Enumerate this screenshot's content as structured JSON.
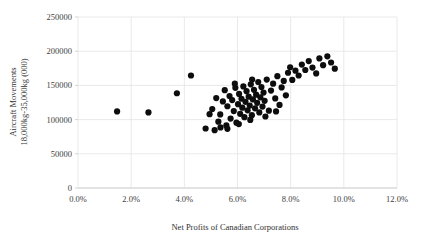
{
  "chart_data": {
    "type": "scatter",
    "title": "",
    "xlabel": "Net Profits of Canadian Corporations",
    "ylabel": "Aircraft Movements 18,000kg-35,000kg (000)",
    "ylabel_line1": "Aircraft Movements",
    "ylabel_line2": "18,000kg-35,000kg (000)",
    "xlim": [
      0,
      12
    ],
    "ylim": [
      0,
      250000
    ],
    "xticks": [
      0,
      2,
      4,
      6,
      8,
      10,
      12
    ],
    "xtick_labels": [
      "0.0%",
      "2.0%",
      "4.0%",
      "6.0%",
      "8.0%",
      "10.0%",
      "12.0%"
    ],
    "yticks": [
      0,
      50000,
      100000,
      150000,
      200000,
      250000
    ],
    "ytick_labels": [
      "0",
      "50000",
      "100000",
      "150000",
      "200000",
      "250000"
    ],
    "grid": true,
    "grid_axis": "both",
    "legend": false,
    "marker_color": "#0d0d0d",
    "marker_size": 3.1,
    "points": [
      [
        1.47,
        112000
      ],
      [
        2.65,
        110500
      ],
      [
        3.72,
        138500
      ],
      [
        4.25,
        164500
      ],
      [
        4.8,
        87000
      ],
      [
        5.05,
        115500
      ],
      [
        5.2,
        131500
      ],
      [
        5.28,
        97000
      ],
      [
        5.35,
        107500
      ],
      [
        5.45,
        126500
      ],
      [
        5.52,
        143000
      ],
      [
        5.58,
        91500
      ],
      [
        5.62,
        119500
      ],
      [
        5.7,
        134500
      ],
      [
        5.74,
        101500
      ],
      [
        5.8,
        128500
      ],
      [
        5.86,
        112500
      ],
      [
        5.92,
        146500
      ],
      [
        5.96,
        95500
      ],
      [
        6.02,
        122500
      ],
      [
        6.06,
        137500
      ],
      [
        6.1,
        108500
      ],
      [
        6.15,
        130500
      ],
      [
        6.18,
        117500
      ],
      [
        6.22,
        148500
      ],
      [
        6.26,
        103500
      ],
      [
        6.3,
        126000
      ],
      [
        6.34,
        141500
      ],
      [
        6.38,
        113500
      ],
      [
        6.42,
        133500
      ],
      [
        6.46,
        120500
      ],
      [
        6.5,
        151500
      ],
      [
        6.54,
        106500
      ],
      [
        6.58,
        129500
      ],
      [
        6.62,
        143500
      ],
      [
        6.66,
        116500
      ],
      [
        6.7,
        136500
      ],
      [
        6.74,
        124500
      ],
      [
        6.78,
        155000
      ],
      [
        6.82,
        110500
      ],
      [
        6.86,
        132500
      ],
      [
        6.9,
        147500
      ],
      [
        6.94,
        119000
      ],
      [
        6.98,
        139500
      ],
      [
        7.02,
        127500
      ],
      [
        7.1,
        158500
      ],
      [
        7.18,
        113000
      ],
      [
        7.26,
        142500
      ],
      [
        7.34,
        152500
      ],
      [
        7.42,
        131000
      ],
      [
        7.5,
        163500
      ],
      [
        7.58,
        121500
      ],
      [
        7.66,
        147000
      ],
      [
        7.74,
        156500
      ],
      [
        7.82,
        135500
      ],
      [
        7.9,
        168500
      ],
      [
        7.98,
        176500
      ],
      [
        8.06,
        158000
      ],
      [
        8.18,
        171500
      ],
      [
        8.3,
        164500
      ],
      [
        8.42,
        180500
      ],
      [
        8.55,
        172500
      ],
      [
        8.68,
        185500
      ],
      [
        8.82,
        176000
      ],
      [
        8.96,
        167500
      ],
      [
        9.08,
        189500
      ],
      [
        9.22,
        179500
      ],
      [
        9.38,
        192500
      ],
      [
        9.52,
        183500
      ],
      [
        9.66,
        174500
      ],
      [
        5.14,
        84500
      ],
      [
        5.36,
        88500
      ],
      [
        5.62,
        86500
      ],
      [
        4.95,
        108000
      ],
      [
        6.05,
        93500
      ],
      [
        6.48,
        99500
      ],
      [
        7.05,
        104500
      ],
      [
        7.45,
        112000
      ],
      [
        5.9,
        152500
      ],
      [
        6.55,
        158500
      ]
    ]
  }
}
